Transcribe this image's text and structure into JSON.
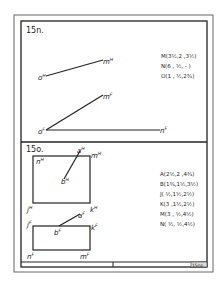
{
  "problems": [
    {
      "id": "15n",
      "label": "15n.",
      "points": [
        "M(3½,2 ,3½)",
        "N(6 , ½, - )",
        "O(1 , ½,2¾)"
      ],
      "projection_labels": {
        "oH": "o",
        "mH": "m",
        "oF": "o",
        "mF": "m",
        "nF": "n"
      }
    },
    {
      "id": "15o",
      "label": "15o.",
      "points": [
        "A(2½,2 ,4¾)",
        "B(1¾,1½,3½)",
        "J( ½,1½,2½)",
        "K(3 ,1½,2½)",
        "M(3 , ½,4½)",
        "N( ½, ½,4½)"
      ],
      "projection_labels": {
        "aH": "a",
        "bH": "b",
        "nH": "n",
        "mH": "m",
        "jH": "j",
        "kH": "k",
        "aF": "a",
        "bF": "b",
        "jF": "j",
        "kF": "k",
        "nF": "n",
        "mF": "m"
      }
    }
  ],
  "superscripts": {
    "H": "H",
    "F": "F"
  },
  "title_block": {
    "sheet_number": "15no"
  }
}
